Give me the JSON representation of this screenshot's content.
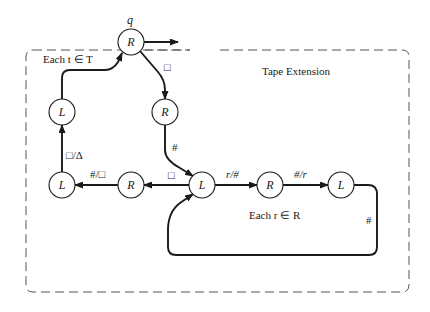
{
  "diagram": {
    "type": "turing-machine-state-diagram",
    "region_label": "Tape Extension",
    "loop_labels": {
      "each_t": "Each t ∈ T",
      "each_r": "Each r ∈ R"
    },
    "start_state_label": "q",
    "nodes": [
      {
        "id": "q",
        "label": "R"
      },
      {
        "id": "n1",
        "label": "R"
      },
      {
        "id": "n2",
        "label": "L"
      },
      {
        "id": "n3",
        "label": "L"
      },
      {
        "id": "n4",
        "label": "R"
      },
      {
        "id": "n5",
        "label": "L"
      },
      {
        "id": "n6",
        "label": "R"
      },
      {
        "id": "n7",
        "label": "L"
      }
    ],
    "edges": [
      {
        "from": "q",
        "to": "exit",
        "label": ""
      },
      {
        "from": "q",
        "to": "n1",
        "label": "□"
      },
      {
        "from": "n1",
        "to": "n5",
        "label": "#"
      },
      {
        "from": "n5",
        "to": "n4",
        "label": "□"
      },
      {
        "from": "n4",
        "to": "n3",
        "label": "#/□"
      },
      {
        "from": "n3",
        "to": "n2",
        "label": "□/Δ"
      },
      {
        "from": "n2",
        "to": "q",
        "label": ""
      },
      {
        "from": "n5",
        "to": "n6",
        "label": "r/#"
      },
      {
        "from": "n6",
        "to": "n7",
        "label": "#/r"
      },
      {
        "from": "n7",
        "to": "n5",
        "label": "#"
      }
    ],
    "colors": {
      "stroke": "#1a1a1a",
      "dash": "#555555",
      "background": "#ffffff"
    }
  }
}
